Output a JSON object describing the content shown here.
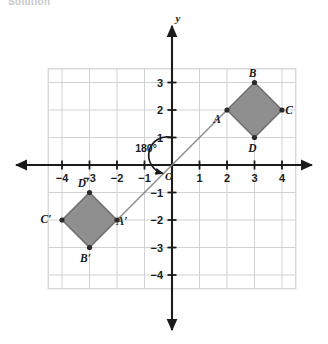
{
  "caption": "Solution",
  "chart_data": {
    "type": "scatter",
    "title": "",
    "xlabel": "",
    "ylabel": "y",
    "origin_label": "O",
    "xlim": [
      -4.5,
      4.5
    ],
    "ylim": [
      -4.5,
      3.5
    ],
    "grid": true,
    "legend": "none",
    "x_ticks": [
      -4,
      -3,
      -2,
      -1,
      1,
      2,
      3,
      4
    ],
    "x_tick_labels": [
      "−4",
      "−3",
      "−2",
      "−1",
      "1",
      "2",
      "3",
      "4"
    ],
    "y_ticks": [
      3,
      2,
      1,
      -1,
      -2,
      -3,
      -4
    ],
    "y_tick_labels": [
      "3",
      "2",
      "1",
      "−1",
      "−2",
      "−3",
      "−4"
    ],
    "annotations": [
      {
        "name": "rotation-angle",
        "text": "180°",
        "x": -0.95,
        "y": 1.0
      }
    ],
    "shapes": [
      {
        "name": "quadrilateral-abcd",
        "fill": "#8f8f8f",
        "stroke": "#6e6e6e",
        "vertices": [
          {
            "label": "A",
            "x": 2,
            "y": 2,
            "label_dx": -10,
            "label_dy": 13
          },
          {
            "label": "B",
            "x": 3,
            "y": 3,
            "label_dx": -2,
            "label_dy": -6
          },
          {
            "label": "C",
            "x": 4,
            "y": 2,
            "label_dx": 7,
            "label_dy": 4
          },
          {
            "label": "D",
            "x": 3,
            "y": 1,
            "label_dx": -2,
            "label_dy": 14
          }
        ]
      },
      {
        "name": "quadrilateral-abcd-prime",
        "fill": "#8f8f8f",
        "stroke": "#6e6e6e",
        "vertices": [
          {
            "label": "A′",
            "x": -2,
            "y": -2,
            "label_dx": 5,
            "label_dy": 5
          },
          {
            "label": "B′",
            "x": -3,
            "y": -3,
            "label_dx": -4,
            "label_dy": 14
          },
          {
            "label": "C′",
            "x": -4,
            "y": -2,
            "label_dx": -16,
            "label_dy": 3
          },
          {
            "label": "D′",
            "x": -3,
            "y": -1,
            "label_dx": -6,
            "label_dy": -6
          }
        ]
      }
    ],
    "rotation_line": {
      "name": "rotation-line",
      "from": {
        "x": 2,
        "y": 2
      },
      "to": {
        "x": -2,
        "y": -2
      }
    }
  },
  "colors": {
    "shape_fill": "#8f8f8f",
    "shape_stroke": "#6e6e6e",
    "grid": "#d2d2d6",
    "axis": "#1b1b1b",
    "caption": "#c9c9cf"
  }
}
